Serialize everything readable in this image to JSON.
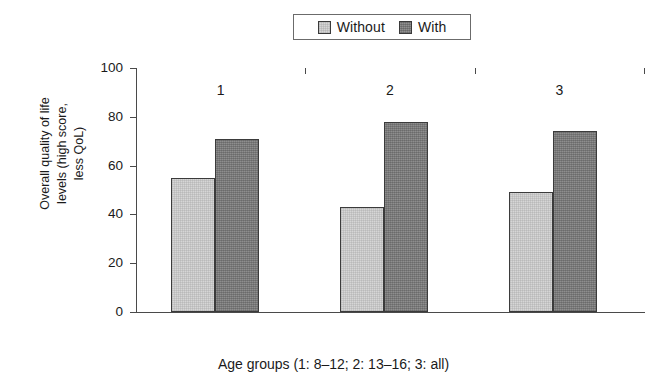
{
  "chart_data": {
    "type": "bar",
    "title": "",
    "categories": [
      "1",
      "2",
      "3"
    ],
    "series": [
      {
        "name": "Without",
        "values": [
          55,
          43,
          49
        ],
        "color": "#d6d6d6"
      },
      {
        "name": "With",
        "values": [
          71,
          78,
          74
        ],
        "color": "#7e7e7e"
      }
    ],
    "xlabel": "Age groups (1: 8–12; 2: 13–16; 3: all)",
    "ylabel_lines": [
      "Overall quality of life",
      "levels (high score,",
      "less QoL)"
    ],
    "ylim": [
      0,
      100
    ],
    "yticks": [
      100,
      80,
      60,
      40,
      20,
      0
    ],
    "xticklabels": [
      "1",
      "2",
      "3"
    ],
    "grid": false,
    "legend_position": "top-center",
    "legend_entries": [
      "Without",
      "With"
    ]
  },
  "legend": {
    "entries": [
      {
        "label": "Without",
        "swatch": "legend-swatch-without"
      },
      {
        "label": "With",
        "swatch": "legend-swatch-with"
      }
    ]
  },
  "axes": {
    "y_title_line1": "Overall quality of life",
    "y_title_line2": "levels (high score,",
    "y_title_line3": "less QoL)",
    "x_title": "Age groups (1: 8–12; 2: 13–16; 3: all)",
    "y_tick_labels": [
      "100",
      "80",
      "60",
      "40",
      "20",
      "0"
    ],
    "x_tick_labels": [
      "1",
      "2",
      "3"
    ]
  }
}
